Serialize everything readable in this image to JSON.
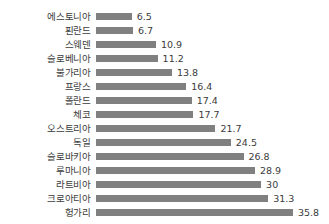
{
  "chart_data": {
    "type": "bar",
    "orientation": "horizontal",
    "title": "",
    "subtitle": "",
    "xlabel": "",
    "ylabel": "",
    "grid": false,
    "legend": null,
    "xlim": [
      0,
      35.8
    ],
    "bar_color": "#808080",
    "text_color": "#3b3b3b",
    "background_color": "#ffffff",
    "categories": [
      "에스토니아",
      "핀란드",
      "스웨덴",
      "슬로베니아",
      "불가리아",
      "프랑스",
      "폴란드",
      "체코",
      "오스트리아",
      "독일",
      "슬로바키아",
      "루마니아",
      "라트비아",
      "크로아티아",
      "헝가리"
    ],
    "values": [
      6.5,
      6.7,
      10.9,
      11.2,
      13.8,
      16.4,
      17.4,
      17.7,
      21.7,
      24.5,
      26.8,
      28.9,
      30,
      31.3,
      35.8
    ],
    "value_labels": [
      "6.5",
      "6.7",
      "10.9",
      "11.2",
      "13.8",
      "16.4",
      "17.4",
      "17.7",
      "21.7",
      "24.5",
      "26.8",
      "28.9",
      "30",
      "31.3",
      "35.8"
    ],
    "rows": [
      {
        "label": "에스토니아",
        "value": 6.5,
        "value_label": "6.5"
      },
      {
        "label": "핀란드",
        "value": 6.7,
        "value_label": "6.7"
      },
      {
        "label": "스웨덴",
        "value": 10.9,
        "value_label": "10.9"
      },
      {
        "label": "슬로베니아",
        "value": 11.2,
        "value_label": "11.2"
      },
      {
        "label": "불가리아",
        "value": 13.8,
        "value_label": "13.8"
      },
      {
        "label": "프랑스",
        "value": 16.4,
        "value_label": "16.4"
      },
      {
        "label": "폴란드",
        "value": 17.4,
        "value_label": "17.4"
      },
      {
        "label": "체코",
        "value": 17.7,
        "value_label": "17.7"
      },
      {
        "label": "오스트리아",
        "value": 21.7,
        "value_label": "21.7"
      },
      {
        "label": "독일",
        "value": 24.5,
        "value_label": "24.5"
      },
      {
        "label": "슬로바키아",
        "value": 26.8,
        "value_label": "26.8"
      },
      {
        "label": "루마니아",
        "value": 28.9,
        "value_label": "28.9"
      },
      {
        "label": "라트비아",
        "value": 30,
        "value_label": "30"
      },
      {
        "label": "크로아티아",
        "value": 31.3,
        "value_label": "31.3"
      },
      {
        "label": "헝가리",
        "value": 35.8,
        "value_label": "35.8"
      }
    ]
  }
}
